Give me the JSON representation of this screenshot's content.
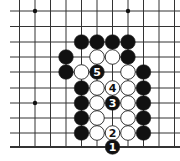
{
  "diagram": {
    "type": "go-board-fragment",
    "grid": {
      "cols_x": [
        19.5,
        35,
        50.5,
        66,
        81.5,
        97,
        112.5,
        128,
        143.5,
        159,
        174.5
      ],
      "rows_y": [
        11,
        26.5,
        42,
        57,
        72,
        88,
        103,
        118,
        133,
        147
      ],
      "line_color": "#333333",
      "edge": "bottom"
    },
    "star_points": [
      {
        "c": 1,
        "r": 0
      },
      {
        "c": 7,
        "r": 0
      },
      {
        "c": 1,
        "r": 6
      }
    ],
    "stones": [
      {
        "color": "black",
        "c": 4,
        "r": 2
      },
      {
        "color": "black",
        "c": 5,
        "r": 2
      },
      {
        "color": "black",
        "c": 6,
        "r": 2
      },
      {
        "color": "black",
        "c": 7,
        "r": 2
      },
      {
        "color": "black",
        "c": 3,
        "r": 3
      },
      {
        "color": "white",
        "c": 5,
        "r": 3
      },
      {
        "color": "white",
        "c": 6,
        "r": 3
      },
      {
        "color": "black",
        "c": 7,
        "r": 3
      },
      {
        "color": "black",
        "c": 3,
        "r": 4
      },
      {
        "color": "white",
        "c": 4,
        "r": 4
      },
      {
        "color": "black",
        "c": 5,
        "r": 4,
        "label": "5"
      },
      {
        "color": "white",
        "c": 7,
        "r": 4
      },
      {
        "color": "black",
        "c": 8,
        "r": 4
      },
      {
        "color": "black",
        "c": 4,
        "r": 5
      },
      {
        "color": "white",
        "c": 5,
        "r": 5
      },
      {
        "color": "white",
        "c": 6,
        "r": 5,
        "label": "4"
      },
      {
        "color": "white",
        "c": 7,
        "r": 5
      },
      {
        "color": "black",
        "c": 8,
        "r": 5
      },
      {
        "color": "black",
        "c": 4,
        "r": 6
      },
      {
        "color": "white",
        "c": 5,
        "r": 6
      },
      {
        "color": "black",
        "c": 6,
        "r": 6,
        "label": "3"
      },
      {
        "color": "white",
        "c": 7,
        "r": 6
      },
      {
        "color": "black",
        "c": 8,
        "r": 6
      },
      {
        "color": "black",
        "c": 4,
        "r": 7
      },
      {
        "color": "white",
        "c": 5,
        "r": 7
      },
      {
        "color": "white",
        "c": 7,
        "r": 7
      },
      {
        "color": "black",
        "c": 8,
        "r": 7
      },
      {
        "color": "black",
        "c": 4,
        "r": 8
      },
      {
        "color": "white",
        "c": 5,
        "r": 8
      },
      {
        "color": "white",
        "c": 6,
        "r": 8,
        "label": "2"
      },
      {
        "color": "white",
        "c": 7,
        "r": 8
      },
      {
        "color": "black",
        "c": 8,
        "r": 8
      },
      {
        "color": "black",
        "c": 6,
        "r": 9,
        "label": "1"
      }
    ],
    "colors": {
      "black_stone": "#111111",
      "white_stone": "#ffffff",
      "stone_outline": "#222222",
      "background": "#ffffff"
    }
  }
}
